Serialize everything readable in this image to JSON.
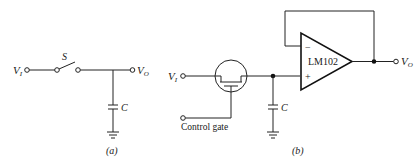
{
  "diagram": {
    "type": "circuit-schematic",
    "panels": [
      {
        "id": "a",
        "caption": "(a)",
        "components": {
          "input_label": "V",
          "input_sub": "I",
          "switch_label": "S",
          "capacitor_label": "C",
          "output_label": "V",
          "output_sub": "O"
        }
      },
      {
        "id": "b",
        "caption": "(b)",
        "components": {
          "input_label": "V",
          "input_sub": "I",
          "fet_switch": "FET",
          "control_label": "Control gate",
          "capacitor_label": "C",
          "opamp_label": "LM102",
          "opamp_inverting": "−",
          "opamp_noninverting": "+",
          "output_label": "V",
          "output_sub": "O"
        }
      }
    ]
  }
}
